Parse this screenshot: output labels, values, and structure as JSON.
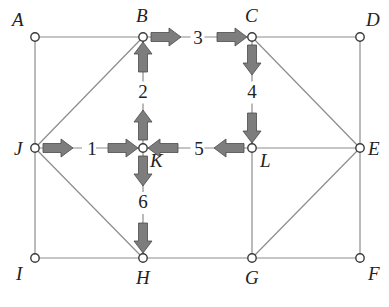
{
  "diagram": {
    "type": "graph-traversal",
    "nodes": [
      {
        "id": "A",
        "label": "A",
        "x": 35,
        "y": 37,
        "lx": 12,
        "ly": 26
      },
      {
        "id": "B",
        "label": "B",
        "x": 143,
        "y": 37,
        "lx": 136,
        "ly": 22
      },
      {
        "id": "C",
        "label": "C",
        "x": 252,
        "y": 37,
        "lx": 245,
        "ly": 22
      },
      {
        "id": "D",
        "label": "D",
        "x": 360,
        "y": 37,
        "lx": 366,
        "ly": 26
      },
      {
        "id": "J",
        "label": "J",
        "x": 35,
        "y": 148,
        "lx": 14,
        "ly": 155
      },
      {
        "id": "K",
        "label": "K",
        "x": 143,
        "y": 148,
        "lx": 150,
        "ly": 167
      },
      {
        "id": "L",
        "label": "L",
        "x": 252,
        "y": 148,
        "lx": 260,
        "ly": 167
      },
      {
        "id": "E",
        "label": "E",
        "x": 360,
        "y": 148,
        "lx": 368,
        "ly": 155
      },
      {
        "id": "I",
        "label": "I",
        "x": 35,
        "y": 258,
        "lx": 16,
        "ly": 280
      },
      {
        "id": "H",
        "label": "H",
        "x": 143,
        "y": 258,
        "lx": 136,
        "ly": 284
      },
      {
        "id": "G",
        "label": "G",
        "x": 252,
        "y": 258,
        "lx": 245,
        "ly": 284
      },
      {
        "id": "F",
        "label": "F",
        "x": 360,
        "y": 258,
        "lx": 368,
        "ly": 280
      }
    ],
    "edges": [
      [
        "A",
        "B"
      ],
      [
        "B",
        "C"
      ],
      [
        "C",
        "D"
      ],
      [
        "J",
        "K"
      ],
      [
        "K",
        "L"
      ],
      [
        "L",
        "E"
      ],
      [
        "I",
        "H"
      ],
      [
        "H",
        "G"
      ],
      [
        "G",
        "F"
      ],
      [
        "A",
        "J"
      ],
      [
        "J",
        "I"
      ],
      [
        "B",
        "K"
      ],
      [
        "K",
        "H"
      ],
      [
        "C",
        "L"
      ],
      [
        "L",
        "G"
      ],
      [
        "D",
        "E"
      ],
      [
        "E",
        "F"
      ],
      [
        "J",
        "B"
      ],
      [
        "J",
        "H"
      ],
      [
        "C",
        "E"
      ],
      [
        "G",
        "E"
      ]
    ],
    "steps": [
      {
        "label": "1",
        "from": "J",
        "to": "K",
        "direction": "right",
        "lx": 92,
        "ly": 155
      },
      {
        "label": "2",
        "from": "K",
        "to": "B",
        "direction": "up",
        "lx": 143,
        "ly": 98
      },
      {
        "label": "3",
        "from": "B",
        "to": "C",
        "direction": "right",
        "lx": 198,
        "ly": 44
      },
      {
        "label": "4",
        "from": "C",
        "to": "L",
        "direction": "down",
        "lx": 252,
        "ly": 98
      },
      {
        "label": "5",
        "from": "L",
        "to": "K",
        "direction": "left",
        "lx": 199,
        "ly": 155
      },
      {
        "label": "6",
        "from": "K",
        "to": "H",
        "direction": "down",
        "lx": 143,
        "ly": 208
      }
    ],
    "colors": {
      "edge": "#8c8c8c",
      "arrow_fill": "#7d7d7d",
      "node_stroke": "#3a3a3a",
      "text": "#222222"
    }
  }
}
